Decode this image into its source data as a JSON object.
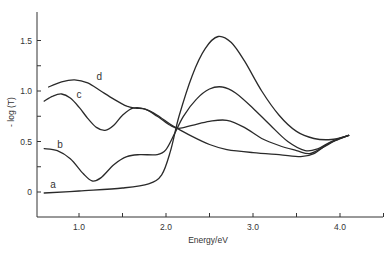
{
  "chart_data": {
    "type": "line",
    "title": "",
    "xlabel": "Energy/eV",
    "ylabel": "- log (T)",
    "xlim": [
      0.5,
      4.5
    ],
    "ylim": [
      -0.25,
      1.75
    ],
    "grid": false,
    "legend": "inline labels near left end of each curve",
    "x_ticks": [
      1.0,
      1.5,
      2.0,
      2.5,
      3.0,
      3.5,
      4.0,
      4.5
    ],
    "x_tick_labels": [
      {
        "value": 1.0,
        "label": "1.0"
      },
      {
        "value": 2.0,
        "label": "2.0"
      },
      {
        "value": 3.0,
        "label": "3.0"
      },
      {
        "value": 4.0,
        "label": "4.0"
      }
    ],
    "y_ticks": [
      0,
      0.25,
      0.5,
      0.75,
      1.0,
      1.25,
      1.5
    ],
    "y_tick_labels": [
      {
        "value": 0,
        "label": "0"
      },
      {
        "value": 0.5,
        "label": "0.5"
      },
      {
        "value": 1.0,
        "label": "1.0"
      },
      {
        "value": 1.5,
        "label": "1.5"
      }
    ],
    "series": [
      {
        "name": "a",
        "label_pos": [
          0.67,
          0.04
        ],
        "x": [
          0.6,
          1.0,
          1.5,
          1.8,
          1.95,
          2.05,
          2.15,
          2.3,
          2.45,
          2.6,
          2.75,
          2.9,
          3.1,
          3.3,
          3.5,
          3.7,
          3.9,
          4.1
        ],
        "y": [
          -0.01,
          0.01,
          0.04,
          0.08,
          0.17,
          0.4,
          0.75,
          1.15,
          1.42,
          1.54,
          1.48,
          1.3,
          1.0,
          0.76,
          0.6,
          0.53,
          0.52,
          0.56
        ]
      },
      {
        "name": "b",
        "label_pos": [
          0.75,
          0.44
        ],
        "x": [
          0.6,
          0.75,
          0.9,
          1.05,
          1.15,
          1.25,
          1.4,
          1.55,
          1.7,
          1.9,
          2.0,
          2.1,
          2.2,
          2.35,
          2.5,
          2.65,
          2.8,
          3.0,
          3.2,
          3.4,
          3.6,
          3.75,
          3.9,
          4.1
        ],
        "y": [
          0.43,
          0.41,
          0.33,
          0.18,
          0.11,
          0.14,
          0.27,
          0.35,
          0.37,
          0.37,
          0.42,
          0.58,
          0.75,
          0.92,
          1.02,
          1.04,
          0.98,
          0.83,
          0.66,
          0.5,
          0.41,
          0.43,
          0.5,
          0.56
        ]
      },
      {
        "name": "c",
        "label_pos": [
          0.97,
          0.93
        ],
        "x": [
          0.6,
          0.7,
          0.8,
          0.9,
          1.0,
          1.1,
          1.2,
          1.3,
          1.4,
          1.5,
          1.62,
          1.76,
          1.9,
          2.05,
          2.15,
          2.3,
          2.5,
          2.7,
          2.9,
          3.1,
          3.3,
          3.5,
          3.65,
          3.8,
          3.95,
          4.1
        ],
        "y": [
          0.9,
          0.95,
          0.97,
          0.93,
          0.84,
          0.73,
          0.64,
          0.61,
          0.66,
          0.76,
          0.83,
          0.82,
          0.75,
          0.66,
          0.63,
          0.66,
          0.7,
          0.71,
          0.64,
          0.53,
          0.46,
          0.41,
          0.38,
          0.44,
          0.51,
          0.56
        ]
      },
      {
        "name": "d",
        "label_pos": [
          1.2,
          1.11
        ],
        "x": [
          0.65,
          0.8,
          0.95,
          1.1,
          1.25,
          1.4,
          1.55,
          1.65,
          1.76,
          1.9,
          2.05,
          2.15,
          2.3,
          2.5,
          2.7,
          3.0,
          3.3,
          3.55,
          3.7,
          3.85,
          4.0,
          4.1
        ],
        "y": [
          1.04,
          1.09,
          1.11,
          1.08,
          1.0,
          0.92,
          0.85,
          0.83,
          0.82,
          0.76,
          0.67,
          0.62,
          0.55,
          0.47,
          0.42,
          0.39,
          0.37,
          0.35,
          0.38,
          0.47,
          0.53,
          0.56
        ]
      }
    ]
  }
}
